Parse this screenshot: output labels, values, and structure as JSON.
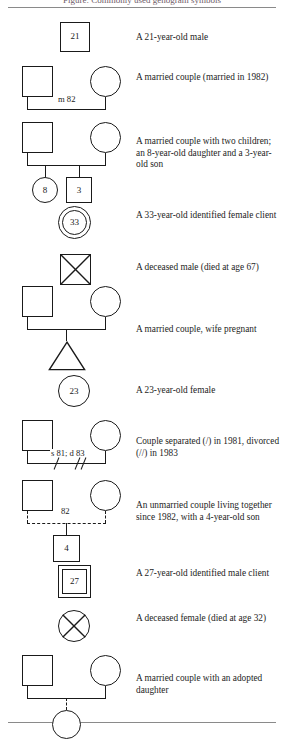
{
  "figure": {
    "caption": "Figure: Commonly used genogram symbols",
    "rules": {
      "top_visible": true,
      "bottom_visible": true
    }
  },
  "colors": {
    "ink": "#1a1a1a",
    "rule": "#8a8a8a",
    "paper": "#ffffff"
  },
  "rows": [
    {
      "id": "male-21",
      "symbol_name": "square-with-age",
      "labels": {
        "age": "21"
      },
      "description": "A 21-year-old male"
    },
    {
      "id": "married-couple",
      "symbol_name": "marriage-line",
      "labels": {
        "union": "m 82"
      },
      "description": "A married couple (married in 1982)"
    },
    {
      "id": "married-two-children",
      "symbol_name": "marriage-with-children",
      "labels": {
        "daughter_age": "8",
        "son_age": "3"
      },
      "description": "A married couple with two children; an 8-year-old daughter and a 3-year-old son"
    },
    {
      "id": "identified-female-client",
      "symbol_name": "double-circle-with-age",
      "labels": {
        "age": "33"
      },
      "description": "A 33-year-old identified female client"
    },
    {
      "id": "deceased-male",
      "symbol_name": "square-with-x",
      "labels": {},
      "description": "A deceased male (died at age 67)"
    },
    {
      "id": "pregnancy",
      "symbol_name": "marriage-with-pregnancy-triangle",
      "labels": {},
      "description": "A married couple, wife pregnant"
    },
    {
      "id": "female-23",
      "symbol_name": "circle-with-age",
      "labels": {
        "age": "23"
      },
      "description": "A 23-year-old female"
    },
    {
      "id": "separated-divorced",
      "symbol_name": "marriage-line-with-separation-slashes",
      "labels": {
        "union": "s 81; d 83"
      },
      "description": "Couple separated (/) in 1981, divorced (//) in 1983"
    },
    {
      "id": "cohabiting-couple",
      "symbol_name": "dashed-union-with-child",
      "labels": {
        "union": "82",
        "son_age": "4"
      },
      "description": "An unmarried couple living together since 1982, with a 4-year-old son"
    },
    {
      "id": "identified-male-client",
      "symbol_name": "double-square-with-age",
      "labels": {
        "age": "27"
      },
      "description": "A 27-year-old identified male client"
    },
    {
      "id": "deceased-female",
      "symbol_name": "circle-with-x",
      "labels": {},
      "description": "A deceased female (died at age 32)"
    },
    {
      "id": "adopted-daughter",
      "symbol_name": "marriage-with-dashed-child-line",
      "labels": {},
      "description": "A married couple with an adopted daughter"
    }
  ]
}
